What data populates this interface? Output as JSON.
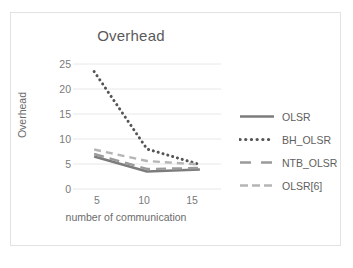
{
  "chart_data": {
    "type": "line",
    "title": "Overhead",
    "xlabel": "number of communication",
    "ylabel": "Overhead",
    "xlim": [
      3,
      17
    ],
    "ylim": [
      0,
      25
    ],
    "xticks": [
      5,
      10,
      15
    ],
    "yticks": [
      0,
      5,
      10,
      15,
      20,
      25
    ],
    "grid": "horizontal",
    "legend_position": "right",
    "x": [
      5,
      10,
      15
    ],
    "series": [
      {
        "name": "OLSR",
        "style": "solid",
        "color": "#7c7c7c",
        "values": [
          6.5,
          3.5,
          3.9
        ]
      },
      {
        "name": "BH_OLSR",
        "style": "dotted",
        "color": "#555555",
        "values": [
          23.5,
          8.0,
          4.9
        ]
      },
      {
        "name": "NTB_OLSR",
        "style": "dashed-long",
        "color": "#9a9a9a",
        "values": [
          7.0,
          4.0,
          4.2
        ]
      },
      {
        "name": "OLSR[6]",
        "style": "dashed",
        "color": "#b5b5b5",
        "values": [
          7.9,
          5.6,
          4.9
        ]
      }
    ]
  },
  "legend": {
    "items": [
      {
        "label": "OLSR"
      },
      {
        "label": "BH_OLSR"
      },
      {
        "label": "NTB_OLSR"
      },
      {
        "label": "OLSR[6]"
      }
    ]
  },
  "axis": {
    "y_tick_labels": [
      "25",
      "20",
      "15",
      "10",
      "5",
      "0"
    ],
    "x_tick_labels": [
      "5",
      "10",
      "15"
    ]
  },
  "colors": {
    "title": "#5a5a5a",
    "axis_text": "#7a7a7a",
    "gridline": "#e8e8e8",
    "frame_border": "#e2e2e2",
    "background": "#ffffff"
  }
}
